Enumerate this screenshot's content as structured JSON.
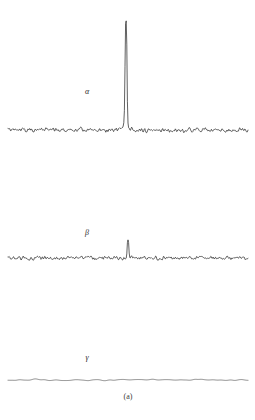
{
  "figure": {
    "caption": "(a)",
    "background_color": "#ffffff",
    "width": 255,
    "height": 420
  },
  "labels": {
    "alpha": "α",
    "beta": "β",
    "gamma": "γ"
  },
  "chart_data": {
    "type": "line",
    "title": "",
    "subtitle": "",
    "xlabel": "",
    "ylabel": "",
    "annotations": [
      "α",
      "β",
      "γ",
      "(a)"
    ],
    "grid": false,
    "legend_position": "none",
    "axis_visible": false,
    "x_range": [
      8,
      248
    ],
    "traces": [
      {
        "name": "α",
        "label": "α",
        "label_x": 87,
        "label_y": 92,
        "baseline_y": 130,
        "color": "#1c1c1c",
        "line_width": 0.7,
        "noise_amplitude": 1.6,
        "noise_seed": 11,
        "smooth": false,
        "peaks": [
          {
            "center_x": 126,
            "height": 108,
            "half_width": 1.1
          }
        ]
      },
      {
        "name": "β",
        "label": "β",
        "label_x": 87,
        "label_y": 233,
        "baseline_y": 258,
        "color": "#1c1c1c",
        "line_width": 0.7,
        "noise_amplitude": 1.5,
        "noise_seed": 47,
        "smooth": false,
        "peaks": [
          {
            "center_x": 128,
            "height": 16,
            "half_width": 1.0
          }
        ]
      },
      {
        "name": "γ",
        "label": "γ",
        "label_x": 87,
        "label_y": 358,
        "baseline_y": 380,
        "color": "#6b6b6b",
        "line_width": 0.8,
        "noise_amplitude": 1.1,
        "noise_seed": 83,
        "smooth": true,
        "peaks": []
      }
    ]
  }
}
